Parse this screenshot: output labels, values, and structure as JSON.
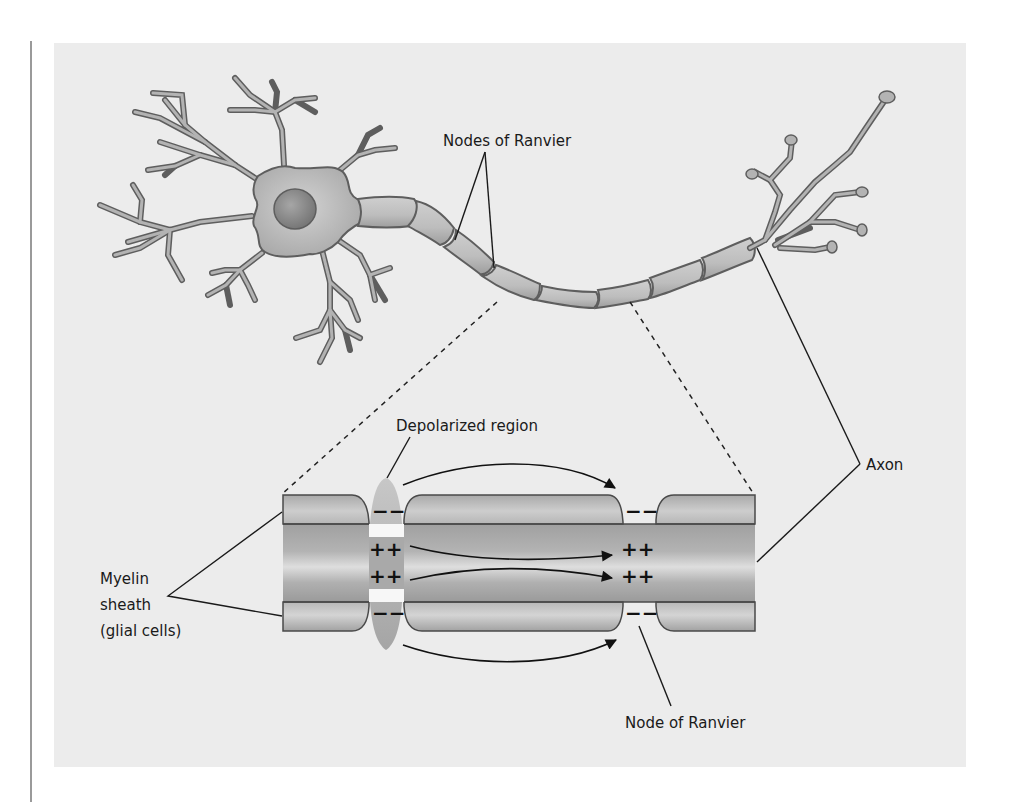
{
  "figure": {
    "labels": {
      "nodes_of_ranvier": "Nodes of Ranvier",
      "axon": "Axon",
      "depolarized_region": "Depolarized region",
      "myelin_sheath_line1": "Myelin",
      "myelin_sheath_line2": "sheath",
      "myelin_sheath_line3": "(glial cells)",
      "node_of_ranvier": "Node of Ranvier"
    },
    "charges": {
      "outside_negative": "−−",
      "inside_positive": "++"
    },
    "colors": {
      "background_panel": "#ececec",
      "cell_fill": "#b8b8b8",
      "cell_outline": "#5a5a5a",
      "nucleus": "#8a8a8a",
      "myelin": "#c4c4c4",
      "axon_core": "#a8a8a8",
      "label_text": "#1a1a1a"
    }
  }
}
